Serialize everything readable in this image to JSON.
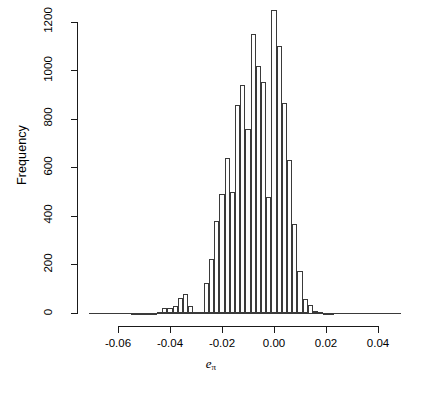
{
  "chart_data": {
    "type": "bar",
    "title": "",
    "subtitle": "",
    "xlabel": "e_pi",
    "xlabel_base": "e",
    "xlabel_sub": "π",
    "ylabel": "Frequency",
    "grid": false,
    "legend": null,
    "xlim": [
      -0.071,
      0.049
    ],
    "ylim": [
      0,
      1260
    ],
    "xticks": [
      -0.06,
      -0.04,
      -0.02,
      0.0,
      0.02,
      0.04
    ],
    "xtick_labels": [
      "-0.06",
      "-0.04",
      "-0.02",
      "0.00",
      "0.02",
      "0.04"
    ],
    "yticks": [
      0,
      200,
      400,
      600,
      800,
      1000,
      1200
    ],
    "ytick_labels": [
      "0",
      "200",
      "400",
      "600",
      "800",
      "1000",
      "1200"
    ],
    "bin_width": 0.002,
    "bin_left_edges": [
      -0.071,
      -0.069,
      -0.067,
      -0.065,
      -0.063,
      -0.061,
      -0.059,
      -0.057,
      -0.055,
      -0.053,
      -0.051,
      -0.049,
      -0.047,
      -0.045,
      -0.043,
      -0.041,
      -0.039,
      -0.037,
      -0.035,
      -0.033,
      -0.031,
      -0.029,
      -0.027,
      -0.025,
      -0.023,
      -0.021,
      -0.019,
      -0.017,
      -0.015,
      -0.013,
      -0.011,
      -0.009,
      -0.007,
      -0.005,
      -0.003,
      -0.001,
      0.001,
      0.003,
      0.005,
      0.007,
      0.009,
      0.011,
      0.013,
      0.015,
      0.017,
      0.019,
      0.021,
      0.023,
      0.025,
      0.027,
      0.029,
      0.031,
      0.033,
      0.035,
      0.037,
      0.039,
      0.041,
      0.043,
      0.045,
      0.047
    ],
    "bin_centers": [
      -0.07,
      -0.068,
      -0.066,
      -0.064,
      -0.062,
      -0.06,
      -0.058,
      -0.056,
      -0.054,
      -0.052,
      -0.05,
      -0.048,
      -0.046,
      -0.044,
      -0.042,
      -0.04,
      -0.038,
      -0.036,
      -0.034,
      -0.032,
      -0.03,
      -0.028,
      -0.026,
      -0.024,
      -0.022,
      -0.02,
      -0.018,
      -0.016,
      -0.014,
      -0.012,
      -0.01,
      -0.008,
      -0.006,
      -0.004,
      -0.002,
      0.0,
      0.002,
      0.004,
      0.006,
      0.008,
      0.01,
      0.012,
      0.014,
      0.016,
      0.018,
      0.02,
      0.022,
      0.024,
      0.026,
      0.028,
      0.03,
      0.032,
      0.034,
      0.036,
      0.038,
      0.04,
      0.042,
      0.044,
      0.046,
      0.048
    ],
    "values": [
      0,
      0,
      0,
      0,
      0,
      0,
      0,
      0,
      2,
      2,
      3,
      4,
      4,
      6,
      22,
      24,
      30,
      65,
      80,
      30,
      8,
      8,
      125,
      225,
      380,
      490,
      640,
      500,
      860,
      940,
      760,
      1150,
      1020,
      955,
      480,
      1250,
      1100,
      865,
      630,
      370,
      175,
      60,
      35,
      12,
      8,
      4,
      3,
      0,
      0,
      0,
      0,
      0,
      0,
      0,
      0,
      0,
      0,
      0,
      0,
      0
    ]
  },
  "axes": {
    "y_axis_name": "frequency-axis",
    "x_axis_name": "e-pi-axis"
  }
}
